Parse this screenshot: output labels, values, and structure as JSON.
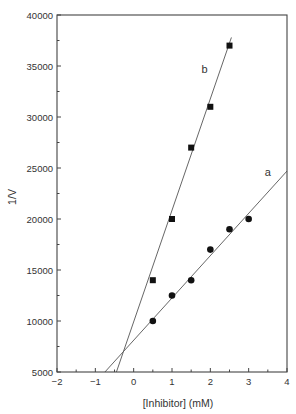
{
  "chart_data": {
    "type": "scatter",
    "title": "",
    "xlabel": "[Inhibitor] (mM)",
    "ylabel": "1/V",
    "xlim": [
      -2,
      4
    ],
    "ylim": [
      5000,
      40000
    ],
    "grid": false,
    "legend": "none (inline labels)",
    "x_ticks": [
      -2,
      -1,
      0,
      1,
      2,
      3,
      4
    ],
    "x_tick_labels": [
      "−2",
      "−1",
      "0",
      "1",
      "2",
      "3",
      "4"
    ],
    "x_minor_step": 0.5,
    "y_ticks": [
      5000,
      10000,
      15000,
      20000,
      25000,
      30000,
      35000,
      40000
    ],
    "y_tick_labels": [
      "5000",
      "10000",
      "15000",
      "20000",
      "25000",
      "30000",
      "35000",
      "40000"
    ],
    "y_minor_step": 2500,
    "series": [
      {
        "name": "a",
        "marker": "circle",
        "x": [
          0.5,
          1.0,
          1.5,
          2.0,
          2.5,
          3.0
        ],
        "y": [
          10000,
          12500,
          14000,
          17000,
          19000,
          20000
        ],
        "fit_line": {
          "x": [
            -0.75,
            4.0
          ],
          "y": [
            5000,
            24700
          ]
        },
        "label_pos": {
          "x": 3.5,
          "y": 24200
        }
      },
      {
        "name": "b",
        "marker": "square",
        "x": [
          0.5,
          1.0,
          1.5,
          2.0,
          2.5
        ],
        "y": [
          14000,
          20000,
          27000,
          31000,
          37000
        ],
        "fit_line": {
          "x": [
            -0.45,
            2.55
          ],
          "y": [
            5000,
            37800
          ]
        },
        "label_pos": {
          "x": 1.85,
          "y": 34300
        }
      }
    ],
    "annotations": [
      "a",
      "b"
    ],
    "intersection_approx": {
      "x": -0.25,
      "y": 7100
    }
  }
}
